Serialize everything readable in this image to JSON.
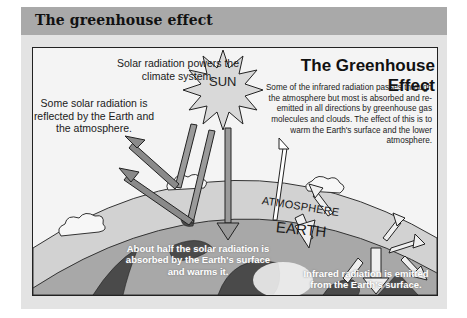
{
  "header": {
    "title": "The greenhouse effect"
  },
  "diagram": {
    "title": "The Greenhouse Effect",
    "sun_label": "SUN",
    "atmosphere_label": "ATMOSPHERE",
    "earth_label": "EARTH",
    "captions": {
      "solar_powers": "Solar radiation powers the climate system.",
      "reflected": "Some solar radiation is reflected by the Earth and the atmosphere.",
      "infrared_description": "Some of the infrared radiation passes through the atmosphere but most is absorbed and re-emitted in all directions by greenhouse gas molecules and clouds. The effect of this is to warm the Earth's surface and the lower atmosphere.",
      "absorbed": "About half the solar radiation is absorbed by the Earth's surface and warms it.",
      "emitted": "Infrared radiation is emitted from the Earth's surface."
    }
  },
  "colors": {
    "header_bg": "#a9a9a9",
    "panel_bg": "#e3e3e3",
    "atmosphere": "#d2d2d2",
    "earth": "#a8a8a8",
    "land": "#4a4a4a",
    "arrow_fill": "#8a8a8a"
  }
}
